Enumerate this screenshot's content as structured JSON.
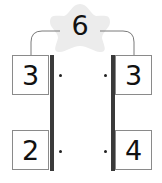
{
  "total": {
    "value": "6",
    "shape": "star-icon",
    "shape_color": "#ececec"
  },
  "left_column": {
    "top": "3",
    "bottom": "2"
  },
  "right_column": {
    "top": "3",
    "bottom": "4"
  },
  "colors": {
    "bar": "#3a3a3a",
    "box_border": "#8a8a8a",
    "connector": "#7a7a7a"
  }
}
